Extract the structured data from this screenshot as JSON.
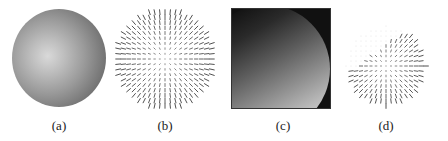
{
  "figure": {
    "panels": [
      {
        "id": "a",
        "label": "(a)",
        "content": "shaded-sphere"
      },
      {
        "id": "b",
        "label": "(b)",
        "content": "needle-map"
      },
      {
        "id": "c",
        "label": "(c)",
        "content": "depth-image"
      },
      {
        "id": "d",
        "label": "(d)",
        "content": "partial-needle-map"
      }
    ],
    "colors": {
      "background": "#ffffff",
      "needle": "#3a3a3a",
      "depth_background": "#111111"
    },
    "needle_map_b": {
      "grid": 19,
      "spacing": 5.2,
      "radius": 50,
      "max_len": 4.6
    },
    "needle_map_d": {
      "grid": 17,
      "spacing": 5.0,
      "radius": 40,
      "max_len": 4.2
    }
  }
}
